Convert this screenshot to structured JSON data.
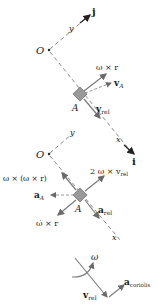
{
  "figure": {
    "panel_velocity": {
      "origin_label": "O",
      "y_axis_label": "y",
      "x_axis_label": "x",
      "unit_j_label": "j",
      "unit_i_label": "i",
      "point_label": "A",
      "vectors": [
        {
          "name": "omega-cross-r",
          "label_main": "ω × r"
        },
        {
          "name": "v-A",
          "label_main": "v",
          "label_sub": "A"
        },
        {
          "name": "v-rel",
          "label_main": "v",
          "label_sub": "rel"
        }
      ]
    },
    "panel_acceleration": {
      "origin_label": "O",
      "y_axis_label": "y",
      "x_axis_label": "x",
      "point_label": "A",
      "vectors": [
        {
          "name": "centripetal",
          "label_main": "ω × (ω × r)"
        },
        {
          "name": "coriolis-2omega",
          "label_main": "2 ω × v",
          "label_sub": "rel"
        },
        {
          "name": "a-A",
          "label_main": "a",
          "label_sub": "A"
        },
        {
          "name": "omega-dot-cross-r",
          "label_main": "ω̇ × r"
        },
        {
          "name": "a-rel",
          "label_main": "a",
          "label_sub": "rel"
        }
      ]
    },
    "panel_coriolis": {
      "omega_label": "ω",
      "v_rel": {
        "label_main": "v",
        "label_sub": "rel"
      },
      "a_coriolis": {
        "label_main": "a",
        "label_sub": "coriolis"
      }
    },
    "colors": {
      "axis_dash": "#8a8a8a",
      "vector": "#7a7a7a",
      "block_fill": "#9a9a9a",
      "text": "#1a1a1a"
    }
  }
}
